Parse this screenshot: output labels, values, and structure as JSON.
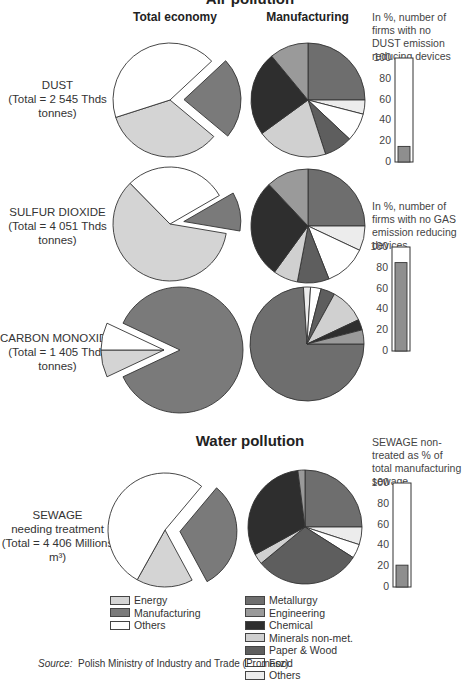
{
  "titles": {
    "air": "Air pollution",
    "water": "Water pollution"
  },
  "column_headers": {
    "total": "Total economy",
    "manufacturing": "Manufacturing"
  },
  "rows": [
    {
      "name": "DUST",
      "total_label": "(Total = 2 545 Thds tonnes)"
    },
    {
      "name": "SULFUR DIOXIDE",
      "total_label": "(Total = 4 051 Thds tonnes)"
    },
    {
      "name": "CARBON MONOXIDE",
      "total_label": "(Total = 1 405 Thds tonnes)"
    },
    {
      "name": "SEWAGE",
      "subname": "needing treatment",
      "total_label": "(Total = 4 406 Millions m³)"
    }
  ],
  "bar_notes": {
    "dust": "In %, number of firms with no DUST emission reducing devices",
    "gas": "In %, number of firms with no GAS emission reducing devices",
    "sewage": "SEWAGE non-treated as % of total manufacturing sewage"
  },
  "axis_ticks": [
    "100",
    "80",
    "60",
    "40",
    "20",
    "0"
  ],
  "legend": {
    "total": [
      {
        "label": "Energy",
        "color": "#d4d4d4"
      },
      {
        "label": "Manufacturing",
        "color": "#7a7a7a"
      },
      {
        "label": "Others",
        "color": "#ffffff"
      }
    ],
    "manufacturing": [
      {
        "label": "Metallurgy",
        "color": "#6e6e6e"
      },
      {
        "label": "Engineering",
        "color": "#9a9a9a"
      },
      {
        "label": "Chemical",
        "color": "#2e2e2e"
      },
      {
        "label": "Minerals non-met.",
        "color": "#d0d0d0"
      },
      {
        "label": "Paper & Wood",
        "color": "#5e5e5e"
      },
      {
        "label": "Food",
        "color": "#ffffff"
      },
      {
        "label": "Others",
        "color": "#ececec"
      }
    ]
  },
  "source": {
    "prefix": "Source:",
    "text": "Polish Ministry of Industry and Trade (Promasz)."
  },
  "chart_data": [
    {
      "type": "pie",
      "title": "DUST - Total economy",
      "categories": [
        "Manufacturing",
        "Energy",
        "Others"
      ],
      "values": [
        23,
        34,
        43
      ],
      "exploded": "Manufacturing"
    },
    {
      "type": "pie",
      "title": "DUST - Manufacturing",
      "categories": [
        "Metallurgy",
        "Others",
        "Food",
        "Paper & Wood",
        "Minerals non-met.",
        "Chemical",
        "Engineering"
      ],
      "values": [
        25,
        4,
        8,
        8,
        20,
        24,
        11
      ]
    },
    {
      "type": "bar",
      "title": "In %, number of firms with no DUST emission reducing devices",
      "categories": [
        "DUST"
      ],
      "values": [
        15
      ],
      "ylim": [
        0,
        100
      ]
    },
    {
      "type": "pie",
      "title": "SULFUR DIOXIDE - Total economy",
      "categories": [
        "Manufacturing",
        "Energy",
        "Others"
      ],
      "values": [
        11,
        60,
        29
      ],
      "exploded": "Manufacturing"
    },
    {
      "type": "pie",
      "title": "SULFUR DIOXIDE - Manufacturing",
      "categories": [
        "Metallurgy",
        "Others",
        "Food",
        "Paper & Wood",
        "Minerals non-met.",
        "Chemical",
        "Engineering"
      ],
      "values": [
        25,
        7,
        12,
        9,
        7,
        28,
        12
      ]
    },
    {
      "type": "bar",
      "title": "In %, number of firms with no GAS emission reducing devices",
      "categories": [
        "GAS"
      ],
      "values": [
        85
      ],
      "ylim": [
        0,
        100
      ]
    },
    {
      "type": "pie",
      "title": "CARBON MONOXIDE - Total economy",
      "categories": [
        "Manufacturing",
        "Energy",
        "Others"
      ],
      "values": [
        86,
        7,
        7
      ],
      "exploded": "Energy+Others"
    },
    {
      "type": "pie",
      "title": "CARBON MONOXIDE - Manufacturing",
      "categories": [
        "Metallurgy",
        "Others",
        "Food",
        "Paper & Wood",
        "Minerals non-met.",
        "Chemical",
        "Engineering"
      ],
      "values": [
        74,
        2,
        3,
        4,
        10,
        3,
        4
      ]
    },
    {
      "type": "pie",
      "title": "SEWAGE needing treatment - Total economy",
      "categories": [
        "Manufacturing",
        "Energy",
        "Others"
      ],
      "values": [
        31,
        16,
        53
      ],
      "exploded": "Manufacturing"
    },
    {
      "type": "pie",
      "title": "SEWAGE - Manufacturing",
      "categories": [
        "Metallurgy",
        "Others",
        "Food",
        "Paper & Wood",
        "Minerals non-met.",
        "Chemical",
        "Engineering"
      ],
      "values": [
        25,
        5,
        4,
        30,
        3,
        31,
        2
      ]
    },
    {
      "type": "bar",
      "title": "SEWAGE non-treated as % of total manufacturing sewage",
      "categories": [
        "SEWAGE"
      ],
      "values": [
        21
      ],
      "ylim": [
        0,
        100
      ]
    }
  ]
}
